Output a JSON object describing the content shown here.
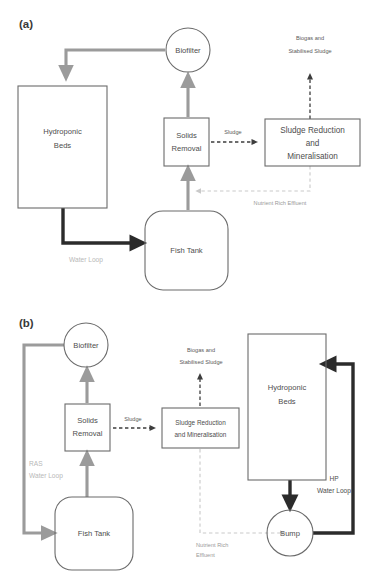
{
  "figure": {
    "panels": [
      {
        "id": "a",
        "label": "(a)",
        "nodes": [
          {
            "key": "biofilter",
            "label": "Biofilter",
            "shape": "circle"
          },
          {
            "key": "hydroponic",
            "label_line1": "Hydroponic",
            "label_line2": "Beds",
            "shape": "rect"
          },
          {
            "key": "solids",
            "label_line1": "Solids",
            "label_line2": "Removal",
            "shape": "rect"
          },
          {
            "key": "sludge",
            "label_line1": "Sludge Reduction",
            "label_line2": "and",
            "label_line3": "Mineralisation",
            "shape": "rect"
          },
          {
            "key": "fishtank",
            "label": "Fish Tank",
            "shape": "rounded-rect"
          }
        ],
        "flow_labels": [
          {
            "key": "biogas",
            "line1": "Biogas and",
            "line2": "Stabilised Sludge"
          },
          {
            "key": "sludge",
            "line1": "Sludge"
          },
          {
            "key": "nutrient",
            "line1": "Nutrient Rich Effluent"
          },
          {
            "key": "waterloop",
            "line1": "Water Loop"
          }
        ]
      },
      {
        "id": "b",
        "label": "(b)",
        "nodes": [
          {
            "key": "biofilter",
            "label": "Biofilter",
            "shape": "circle"
          },
          {
            "key": "solids",
            "label_line1": "Solids",
            "label_line2": "Removal",
            "shape": "rect"
          },
          {
            "key": "sludge",
            "label_line1": "Sludge Reduction",
            "label_line2": "and Mineralisation",
            "shape": "rect"
          },
          {
            "key": "hydroponic",
            "label_line1": "Hydroponic",
            "label_line2": "Beds",
            "shape": "rect"
          },
          {
            "key": "fishtank",
            "label": "Fish Tank",
            "shape": "rounded-rect"
          },
          {
            "key": "sump",
            "label": "Sump",
            "shape": "circle"
          }
        ],
        "flow_labels": [
          {
            "key": "biogas",
            "line1": "Biogas and",
            "line2": "Stabilised Sludge"
          },
          {
            "key": "sludge",
            "line1": "Sludge"
          },
          {
            "key": "nutrient",
            "line1": "Nutrient Rich",
            "line2": "Effluent"
          },
          {
            "key": "ras",
            "line1": "RAS",
            "line2": "Water Loop"
          },
          {
            "key": "hp",
            "line1": "HP",
            "line2": "Water Loop"
          }
        ]
      }
    ]
  },
  "colors": {
    "background": "#ffffff",
    "node_stroke": "#6b6b6b",
    "node_text": "#4d4d4d",
    "arrow_grey": "#9b9b9b",
    "arrow_black": "#2b2b2b",
    "dash_dark": "#3d3d3d",
    "dash_faint": "#c9c9c9",
    "label_faint": "#b8b8b8",
    "panel_label": "#3a3a3a"
  }
}
